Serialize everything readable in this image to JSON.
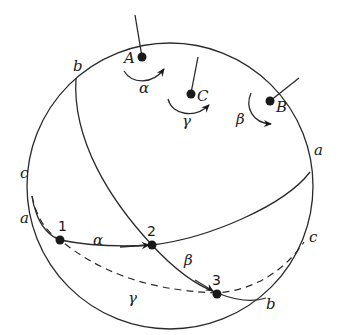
{
  "diagram": {
    "sphere": {
      "cx": 170,
      "cy": 186,
      "r": 143
    },
    "poles": [
      {
        "label": "A",
        "rotation_label": "α"
      },
      {
        "label": "C",
        "rotation_label": "γ"
      },
      {
        "label": "B",
        "rotation_label": "β"
      }
    ],
    "points": [
      {
        "label": "1"
      },
      {
        "label": "2"
      },
      {
        "label": "3"
      }
    ],
    "arc_labels": {
      "alpha": "α",
      "beta": "β",
      "gamma": "γ"
    },
    "circle_labels": {
      "b_top": "b",
      "c_left": "c",
      "a_left": "a",
      "a_right": "a",
      "c_right": "c",
      "b_bottom": "b"
    },
    "colors": {
      "ink": "#1a1a1a",
      "background": "#ffffff"
    }
  }
}
